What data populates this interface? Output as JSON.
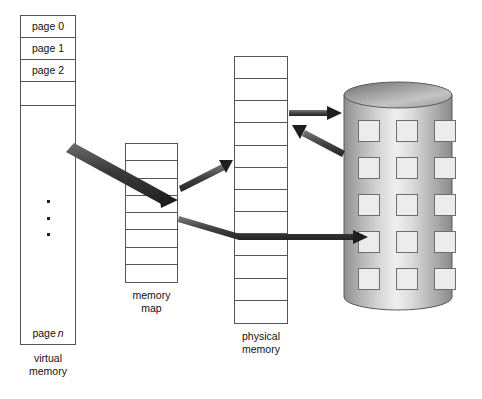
{
  "diagram": {
    "background_color": "#ffffff",
    "line_color": "#555555",
    "arrow_color": "#3a3a3a"
  },
  "virtual_memory": {
    "caption_line1": "virtual",
    "caption_line2": "memory",
    "cells": [
      {
        "label": "page 0"
      },
      {
        "label": "page 1"
      },
      {
        "label": "page 2"
      },
      {
        "label": ""
      },
      {
        "label": ""
      },
      {
        "label": ""
      },
      {
        "label": ""
      },
      {
        "label": ""
      },
      {
        "label": ""
      },
      {
        "label": ""
      },
      {
        "label": ""
      },
      {
        "label": ""
      },
      {
        "label": ""
      },
      {
        "label": "page ",
        "italic": "n"
      }
    ],
    "ellipsis": "• • •"
  },
  "memory_map": {
    "caption_line1": "memory",
    "caption_line2": "map",
    "row_count": 8
  },
  "physical_memory": {
    "caption_line1": "physical",
    "caption_line2": "memory",
    "row_count": 12
  },
  "disk": {
    "name": "disk-cylinder",
    "block_rows": 5,
    "block_cols": 3,
    "block_color": "#ececec"
  },
  "arrows": [
    {
      "name": "virtual-to-map-arrow",
      "from": "virtual memory",
      "to": "memory map"
    },
    {
      "name": "map-to-physical-arrow",
      "from": "memory map",
      "to": "physical memory"
    },
    {
      "name": "map-to-disk-arrow",
      "from": "memory map",
      "to": "disk"
    },
    {
      "name": "physical-to-disk-arrow",
      "from": "physical memory",
      "to": "disk"
    },
    {
      "name": "disk-to-physical-arrow",
      "from": "disk",
      "to": "physical memory"
    }
  ]
}
